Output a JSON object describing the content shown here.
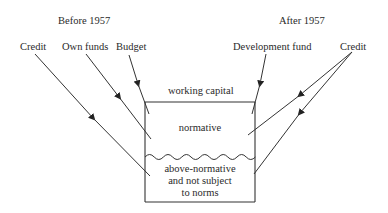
{
  "headers": {
    "before": "Before 1957",
    "after": "After 1957"
  },
  "sources": {
    "credit_left": "Credit",
    "own_funds": "Own funds",
    "budget": "Budget",
    "development_fund": "Development fund",
    "credit_right": "Credit"
  },
  "box": {
    "title": "working capital",
    "upper": "normative",
    "lower_line1": "above-normative",
    "lower_line2": "and not subject",
    "lower_line3": "to norms"
  },
  "colors": {
    "line": "#333333",
    "background": "#ffffff"
  }
}
